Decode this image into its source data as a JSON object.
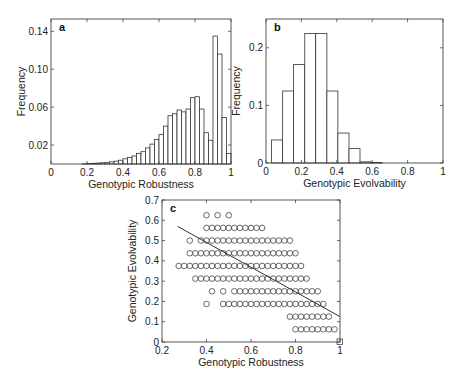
{
  "chart_data": [
    {
      "id": "a",
      "type": "bar",
      "panel_label": "a",
      "title": "",
      "xlabel": "Genotypic Robustness",
      "ylabel": "Frequency",
      "xlim": [
        0,
        1
      ],
      "ylim": [
        0,
        0.153
      ],
      "xticks": [
        0,
        0.2,
        0.4,
        0.6,
        0.8,
        1
      ],
      "xtick_labels": [
        "0",
        "0.2",
        "0.4",
        "0.6",
        "0.8",
        "1"
      ],
      "yticks": [
        0.02,
        0.06,
        0.1,
        0.14
      ],
      "ytick_labels": [
        "0.02",
        "0.06",
        "0.10",
        "0.14"
      ],
      "bin_width": 0.025,
      "bin_starts": [
        0.175,
        0.2,
        0.225,
        0.25,
        0.275,
        0.3,
        0.325,
        0.35,
        0.375,
        0.4,
        0.425,
        0.45,
        0.475,
        0.5,
        0.525,
        0.55,
        0.575,
        0.6,
        0.625,
        0.65,
        0.675,
        0.7,
        0.725,
        0.75,
        0.775,
        0.8,
        0.825,
        0.85,
        0.875,
        0.9,
        0.925,
        0.95,
        0.975
      ],
      "values": [
        0.0003,
        0.0005,
        0.0007,
        0.001,
        0.0013,
        0.0017,
        0.0023,
        0.003,
        0.004,
        0.0055,
        0.007,
        0.0085,
        0.011,
        0.013,
        0.017,
        0.021,
        0.026,
        0.031,
        0.04,
        0.051,
        0.053,
        0.057,
        0.055,
        0.058,
        0.07,
        0.071,
        0.058,
        0.033,
        0.025,
        0.135,
        0.116,
        0.049,
        0.011
      ],
      "grid": false,
      "legend": null
    },
    {
      "id": "b",
      "type": "bar",
      "panel_label": "b",
      "title": "",
      "xlabel": "Genotypic Evolvability",
      "ylabel": "Frequency",
      "xlim": [
        0,
        1
      ],
      "ylim": [
        0,
        0.25
      ],
      "xticks": [
        0,
        0.2,
        0.4,
        0.6,
        0.8,
        1
      ],
      "xtick_labels": [
        "0",
        "0.2",
        "0.4",
        "0.6",
        "0.8",
        "1"
      ],
      "yticks": [
        0,
        0.1,
        0.2
      ],
      "ytick_labels": [
        "0",
        "0.1",
        "0.2"
      ],
      "bin_edges": [
        0.031,
        0.094,
        0.156,
        0.219,
        0.281,
        0.344,
        0.406,
        0.469,
        0.531,
        0.594,
        0.656
      ],
      "values": [
        0.04,
        0.125,
        0.171,
        0.225,
        0.225,
        0.125,
        0.052,
        0.025,
        0.002,
        0.001
      ],
      "grid": false,
      "legend": null
    },
    {
      "id": "c",
      "type": "scatter",
      "panel_label": "c",
      "title": "",
      "xlabel": "Genotypic Robustness",
      "ylabel": "Genotypic Evolvability",
      "xlim": [
        0.2,
        1
      ],
      "ylim": [
        0,
        0.7
      ],
      "xticks": [
        0.2,
        0.4,
        0.6,
        0.8,
        1
      ],
      "xtick_labels": [
        "0.2",
        "0.4",
        "0.6",
        "0.8",
        "1"
      ],
      "yticks": [
        0,
        0.1,
        0.2,
        0.3,
        0.4,
        0.5,
        0.6,
        0.7
      ],
      "ytick_labels": [
        "0",
        "0.1",
        "0.2",
        "0.3",
        "0.4",
        "0.5",
        "0.6",
        "0.7"
      ],
      "marker": "circle-open",
      "rows": [
        {
          "y": 0.625,
          "xs": [
            0.4,
            0.45,
            0.5
          ]
        },
        {
          "y": 0.5625,
          "x_start": 0.4,
          "x_end": 0.65,
          "step": 0.025
        },
        {
          "y": 0.5,
          "xs_extra": [
            0.325
          ],
          "x_start": 0.375,
          "x_end": 0.775,
          "step": 0.025
        },
        {
          "y": 0.4375,
          "x_start": 0.325,
          "x_end": 0.8,
          "step": 0.025
        },
        {
          "y": 0.375,
          "x_start": 0.275,
          "x_end": 0.825,
          "step": 0.025
        },
        {
          "y": 0.3125,
          "x_start": 0.35,
          "x_end": 0.85,
          "step": 0.025
        },
        {
          "y": 0.25,
          "xs_extra": [
            0.425,
            0.475
          ],
          "x_start": 0.525,
          "x_end": 0.9,
          "step": 0.025
        },
        {
          "y": 0.1875,
          "xs_extra": [
            0.4
          ],
          "x_start": 0.475,
          "x_end": 0.925,
          "step": 0.025
        },
        {
          "y": 0.125,
          "x_start": 0.775,
          "x_end": 0.95,
          "step": 0.025
        },
        {
          "y": 0.0625,
          "x_start": 0.8,
          "x_end": 0.975,
          "step": 0.025
        },
        {
          "y": 0.0,
          "xs": [
            1.0
          ],
          "marker": "square-open"
        }
      ],
      "fit_line": {
        "x": [
          0.27,
          1.0
        ],
        "y": [
          0.57,
          0.125
        ]
      },
      "grid": false,
      "legend": null
    }
  ]
}
